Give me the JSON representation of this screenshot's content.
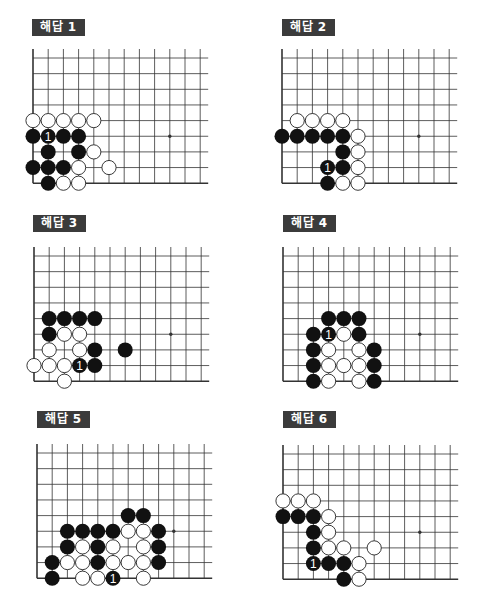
{
  "grid": {
    "cols": 12,
    "rows": 9,
    "dx": 15.2,
    "dy": 15.65,
    "stone_diameter": 15,
    "star_point": {
      "col": 9,
      "row": 3
    },
    "colors": {
      "line": "#333333",
      "black": "#111111",
      "white": "#ffffff",
      "label_bg": "#3b3b3b",
      "label_text": "#ffffff"
    }
  },
  "boards": [
    {
      "id": 1,
      "label": "해답 1",
      "label_pos": {
        "x": 32,
        "y": 19
      },
      "origin": {
        "x": 33,
        "y": 182.7
      },
      "black": [
        [
          0,
          3
        ],
        [
          1,
          3
        ],
        [
          2,
          3
        ],
        [
          3,
          3
        ],
        [
          1,
          2
        ],
        [
          3,
          2
        ],
        [
          0,
          1
        ],
        [
          1,
          1
        ],
        [
          2,
          1
        ],
        [
          1,
          0
        ]
      ],
      "white": [
        [
          0,
          4
        ],
        [
          1,
          4
        ],
        [
          2,
          4
        ],
        [
          3,
          4
        ],
        [
          4,
          4
        ],
        [
          4,
          2
        ],
        [
          3,
          1
        ],
        [
          5,
          1
        ],
        [
          2,
          0
        ],
        [
          3,
          0
        ]
      ],
      "marked": {
        "col": 1,
        "row": 3,
        "text": "1"
      }
    },
    {
      "id": 2,
      "label": "해답 2",
      "label_pos": {
        "x": 282,
        "y": 19
      },
      "origin": {
        "x": 282.3,
        "y": 182.7
      },
      "black": [
        [
          0,
          3
        ],
        [
          1,
          3
        ],
        [
          2,
          3
        ],
        [
          3,
          3
        ],
        [
          4,
          3
        ],
        [
          4,
          2
        ],
        [
          3,
          1
        ],
        [
          4,
          1
        ],
        [
          3,
          0
        ]
      ],
      "white": [
        [
          1,
          4
        ],
        [
          2,
          4
        ],
        [
          3,
          4
        ],
        [
          4,
          4
        ],
        [
          5,
          3
        ],
        [
          5,
          2
        ],
        [
          5,
          1
        ],
        [
          4,
          0
        ],
        [
          5,
          0
        ]
      ],
      "marked": {
        "col": 3,
        "row": 1,
        "text": "1"
      }
    },
    {
      "id": 3,
      "label": "해답 3",
      "label_pos": {
        "x": 33,
        "y": 215
      },
      "origin": {
        "x": 33.5,
        "y": 380.7
      },
      "black": [
        [
          1,
          4
        ],
        [
          2,
          4
        ],
        [
          3,
          4
        ],
        [
          4,
          4
        ],
        [
          1,
          3
        ],
        [
          4,
          2
        ],
        [
          6,
          2
        ],
        [
          3,
          1
        ],
        [
          4,
          1
        ]
      ],
      "white": [
        [
          2,
          3
        ],
        [
          3,
          3
        ],
        [
          1,
          2
        ],
        [
          3,
          2
        ],
        [
          0,
          1
        ],
        [
          1,
          1
        ],
        [
          2,
          1
        ],
        [
          2,
          0
        ]
      ],
      "marked": {
        "col": 3,
        "row": 1,
        "text": "1"
      }
    },
    {
      "id": 4,
      "label": "해답 4",
      "label_pos": {
        "x": 283,
        "y": 215
      },
      "origin": {
        "x": 282.7,
        "y": 381
      },
      "black": [
        [
          3,
          4
        ],
        [
          4,
          4
        ],
        [
          5,
          4
        ],
        [
          2,
          3
        ],
        [
          3,
          3
        ],
        [
          5,
          3
        ],
        [
          2,
          2
        ],
        [
          6,
          2
        ],
        [
          2,
          1
        ],
        [
          6,
          1
        ],
        [
          2,
          0
        ],
        [
          6,
          0
        ]
      ],
      "white": [
        [
          4,
          3
        ],
        [
          3,
          2
        ],
        [
          5,
          2
        ],
        [
          3,
          1
        ],
        [
          4,
          1
        ],
        [
          5,
          1
        ],
        [
          3,
          0
        ],
        [
          5,
          0
        ]
      ],
      "marked": {
        "col": 3,
        "row": 3,
        "text": "1"
      }
    },
    {
      "id": 5,
      "label": "해답 5",
      "label_pos": {
        "x": 37,
        "y": 411
      },
      "origin": {
        "x": 36.7,
        "y": 578.3
      },
      "black": [
        [
          6,
          4
        ],
        [
          7,
          4
        ],
        [
          2,
          3
        ],
        [
          3,
          3
        ],
        [
          4,
          3
        ],
        [
          5,
          3
        ],
        [
          8,
          3
        ],
        [
          2,
          2
        ],
        [
          4,
          2
        ],
        [
          8,
          2
        ],
        [
          1,
          1
        ],
        [
          4,
          1
        ],
        [
          8,
          1
        ],
        [
          1,
          0
        ],
        [
          5,
          0
        ]
      ],
      "white": [
        [
          6,
          3
        ],
        [
          7,
          3
        ],
        [
          3,
          2
        ],
        [
          5,
          2
        ],
        [
          7,
          2
        ],
        [
          2,
          1
        ],
        [
          3,
          1
        ],
        [
          5,
          1
        ],
        [
          6,
          1
        ],
        [
          7,
          1
        ],
        [
          3,
          0
        ],
        [
          4,
          0
        ],
        [
          7,
          0
        ]
      ],
      "marked": {
        "col": 5,
        "row": 0,
        "text": "1"
      }
    },
    {
      "id": 6,
      "label": "해답 6",
      "label_pos": {
        "x": 283,
        "y": 411
      },
      "origin": {
        "x": 283.3,
        "y": 579
      },
      "black": [
        [
          0,
          4
        ],
        [
          1,
          4
        ],
        [
          2,
          4
        ],
        [
          2,
          3
        ],
        [
          2,
          2
        ],
        [
          2,
          1
        ],
        [
          3,
          1
        ],
        [
          4,
          1
        ],
        [
          4,
          0
        ]
      ],
      "white": [
        [
          0,
          5
        ],
        [
          1,
          5
        ],
        [
          2,
          5
        ],
        [
          3,
          4
        ],
        [
          3,
          3
        ],
        [
          3,
          2
        ],
        [
          4,
          2
        ],
        [
          6,
          2
        ],
        [
          5,
          1
        ],
        [
          5,
          0
        ]
      ],
      "marked": {
        "col": 2,
        "row": 1,
        "text": "1"
      }
    }
  ]
}
